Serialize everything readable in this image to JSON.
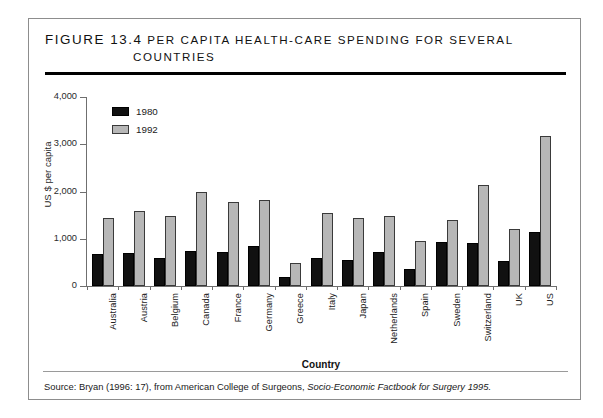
{
  "figure": {
    "number": "Figure 13.4",
    "title_line1": "Per Capita Health-Care Spending for Several",
    "title_line2": "Countries",
    "source_prefix": "Source:  Bryan (1996: 17), from American College of Surgeons,",
    "source_italic": "Socio-Economic Factbook for Surgery 1995."
  },
  "colors": {
    "series_1980": "#111111",
    "series_1992": "#b7b7b7",
    "axis": "#6f6f6f",
    "rule": "#000000",
    "frame": "#8d8d8d"
  },
  "legend": {
    "items": [
      {
        "label": "1980",
        "swatch": "black"
      },
      {
        "label": "1992",
        "swatch": "gray"
      }
    ]
  },
  "axes": {
    "y_title": "US $ per capita",
    "x_title": "Country",
    "y_ticks": [
      "4,000",
      "3,000",
      "2,000",
      "1,000",
      "0"
    ]
  },
  "chart_data": {
    "type": "bar",
    "title": "Figure 13.4 Per Capita Health-Care Spending for Several Countries",
    "xlabel": "Country",
    "ylabel": "US $ per capita",
    "ylim": [
      0,
      4000
    ],
    "yticks": [
      0,
      1000,
      2000,
      3000,
      4000
    ],
    "grid": false,
    "legend_position": "top-left inside plot",
    "categories": [
      "Australia",
      "Austria",
      "Belgium",
      "Canada",
      "France",
      "Germany",
      "Greece",
      "Italy",
      "Japan",
      "Netherlands",
      "Spain",
      "Sweden",
      "Switzerland",
      "UK",
      "US"
    ],
    "series": [
      {
        "name": "1980",
        "color": "#111111",
        "values": [
          680,
          700,
          590,
          750,
          720,
          840,
          200,
          600,
          560,
          720,
          350,
          930,
          920,
          530,
          1150
        ]
      },
      {
        "name": "1992",
        "color": "#b7b7b7",
        "values": [
          1450,
          1580,
          1490,
          1990,
          1780,
          1830,
          490,
          1540,
          1430,
          1490,
          960,
          1390,
          2140,
          1210,
          3170
        ]
      }
    ]
  }
}
